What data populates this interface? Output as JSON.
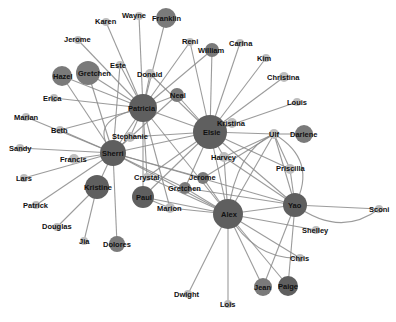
{
  "colors": {
    "large_node": "#5f5f5f",
    "medium_node": "#7a7a7a",
    "small_node": "#bdbdbd",
    "edge": "#8a8a8a",
    "label": "#111111"
  },
  "nodes": [
    {
      "id": "Wayne",
      "x": 139,
      "y": 16,
      "r": 4,
      "tone": "small",
      "lx": 122,
      "ly": 18
    },
    {
      "id": "Franklin",
      "x": 166,
      "y": 18,
      "r": 10,
      "tone": "medium",
      "lx": 152,
      "ly": 21
    },
    {
      "id": "Karen",
      "x": 106,
      "y": 22,
      "r": 4,
      "tone": "small",
      "lx": 95,
      "ly": 24
    },
    {
      "id": "Jerome",
      "x": 78,
      "y": 40,
      "r": 4,
      "tone": "small",
      "lx": 64,
      "ly": 42
    },
    {
      "id": "Este",
      "x": 120,
      "y": 65,
      "r": 4,
      "tone": "small",
      "lx": 110,
      "ly": 68
    },
    {
      "id": "Hazel",
      "x": 62,
      "y": 76,
      "r": 10,
      "tone": "medium",
      "lx": 53,
      "ly": 79
    },
    {
      "id": "Gretchen",
      "x": 88,
      "y": 73,
      "r": 12,
      "tone": "medium",
      "lx": 78,
      "ly": 76
    },
    {
      "id": "Donald",
      "x": 150,
      "y": 74,
      "r": 5,
      "tone": "small",
      "lx": 137,
      "ly": 77
    },
    {
      "id": "Reni",
      "x": 190,
      "y": 42,
      "r": 4,
      "tone": "small",
      "lx": 182,
      "ly": 44
    },
    {
      "id": "William",
      "x": 212,
      "y": 50,
      "r": 7,
      "tone": "medium",
      "lx": 198,
      "ly": 53
    },
    {
      "id": "Carina",
      "x": 240,
      "y": 43,
      "r": 4,
      "tone": "small",
      "lx": 229,
      "ly": 46
    },
    {
      "id": "Kim",
      "x": 266,
      "y": 58,
      "r": 4,
      "tone": "small",
      "lx": 257,
      "ly": 61
    },
    {
      "id": "Christina",
      "x": 284,
      "y": 77,
      "r": 5,
      "tone": "small",
      "lx": 267,
      "ly": 80
    },
    {
      "id": "Louis",
      "x": 297,
      "y": 102,
      "r": 4,
      "tone": "small",
      "lx": 287,
      "ly": 105
    },
    {
      "id": "Erica",
      "x": 54,
      "y": 98,
      "r": 4,
      "tone": "small",
      "lx": 43,
      "ly": 101
    },
    {
      "id": "Neal",
      "x": 177,
      "y": 95,
      "r": 7,
      "tone": "medium",
      "lx": 170,
      "ly": 98
    },
    {
      "id": "Patricia",
      "x": 143,
      "y": 108,
      "r": 14,
      "tone": "large",
      "lx": 128,
      "ly": 111
    },
    {
      "id": "Kristina",
      "x": 232,
      "y": 123,
      "r": 5,
      "tone": "small",
      "lx": 217,
      "ly": 126
    },
    {
      "id": "Elsie",
      "x": 210,
      "y": 132,
      "r": 17,
      "tone": "large",
      "lx": 203,
      "ly": 135
    },
    {
      "id": "Marian",
      "x": 26,
      "y": 117,
      "r": 4,
      "tone": "small",
      "lx": 14,
      "ly": 120
    },
    {
      "id": "Beth",
      "x": 60,
      "y": 130,
      "r": 4,
      "tone": "small",
      "lx": 51,
      "ly": 133
    },
    {
      "id": "Stephanie",
      "x": 130,
      "y": 137,
      "r": 5,
      "tone": "small",
      "lx": 112,
      "ly": 139
    },
    {
      "id": "Ulf",
      "x": 274,
      "y": 134,
      "r": 5,
      "tone": "small",
      "lx": 269,
      "ly": 137
    },
    {
      "id": "Darlene",
      "x": 304,
      "y": 134,
      "r": 9,
      "tone": "medium",
      "lx": 290,
      "ly": 137
    },
    {
      "id": "Sandy",
      "x": 20,
      "y": 148,
      "r": 4,
      "tone": "small",
      "lx": 9,
      "ly": 151
    },
    {
      "id": "Sherri",
      "x": 113,
      "y": 153,
      "r": 13,
      "tone": "large",
      "lx": 102,
      "ly": 156
    },
    {
      "id": "Francis",
      "x": 74,
      "y": 159,
      "r": 5,
      "tone": "small",
      "lx": 60,
      "ly": 162
    },
    {
      "id": "Harvey",
      "x": 224,
      "y": 157,
      "r": 5,
      "tone": "small",
      "lx": 211,
      "ly": 160
    },
    {
      "id": "Priscilla",
      "x": 290,
      "y": 169,
      "r": 5,
      "tone": "small",
      "lx": 276,
      "ly": 171
    },
    {
      "id": "Lars",
      "x": 24,
      "y": 178,
      "r": 4,
      "tone": "small",
      "lx": 16,
      "ly": 181
    },
    {
      "id": "Crystal",
      "x": 147,
      "y": 177,
      "r": 4,
      "tone": "small",
      "lx": 134,
      "ly": 180
    },
    {
      "id": "Jerome2",
      "label": "Jerome",
      "x": 203,
      "y": 178,
      "r": 6,
      "tone": "medium",
      "lx": 189,
      "ly": 180
    },
    {
      "id": "Kristine",
      "x": 97,
      "y": 187,
      "r": 12,
      "tone": "large",
      "lx": 84,
      "ly": 190
    },
    {
      "id": "Gretchen2",
      "label": "Gretchen",
      "x": 185,
      "y": 188,
      "r": 6,
      "tone": "medium",
      "lx": 168,
      "ly": 191
    },
    {
      "id": "Paul",
      "x": 143,
      "y": 197,
      "r": 11,
      "tone": "large",
      "lx": 136,
      "ly": 200
    },
    {
      "id": "Marion",
      "x": 170,
      "y": 208,
      "r": 5,
      "tone": "small",
      "lx": 157,
      "ly": 211
    },
    {
      "id": "Yao",
      "x": 295,
      "y": 205,
      "r": 12,
      "tone": "large",
      "lx": 288,
      "ly": 208
    },
    {
      "id": "Alex",
      "x": 228,
      "y": 214,
      "r": 15,
      "tone": "large",
      "lx": 221,
      "ly": 217
    },
    {
      "id": "Sconi",
      "x": 379,
      "y": 209,
      "r": 4,
      "tone": "small",
      "lx": 369,
      "ly": 212
    },
    {
      "id": "Patrick",
      "x": 36,
      "y": 205,
      "r": 4,
      "tone": "small",
      "lx": 23,
      "ly": 208
    },
    {
      "id": "Shelley",
      "x": 316,
      "y": 230,
      "r": 4,
      "tone": "small",
      "lx": 302,
      "ly": 233
    },
    {
      "id": "Douglas",
      "x": 57,
      "y": 227,
      "r": 4,
      "tone": "small",
      "lx": 42,
      "ly": 229
    },
    {
      "id": "Jia",
      "x": 84,
      "y": 241,
      "r": 4,
      "tone": "small",
      "lx": 79,
      "ly": 244
    },
    {
      "id": "Dolores",
      "x": 117,
      "y": 244,
      "r": 8,
      "tone": "medium",
      "lx": 103,
      "ly": 247
    },
    {
      "id": "Chris",
      "x": 300,
      "y": 258,
      "r": 4,
      "tone": "small",
      "lx": 290,
      "ly": 261
    },
    {
      "id": "Jean",
      "x": 263,
      "y": 287,
      "r": 9,
      "tone": "medium",
      "lx": 254,
      "ly": 290
    },
    {
      "id": "Paige",
      "x": 288,
      "y": 286,
      "r": 10,
      "tone": "large",
      "lx": 278,
      "ly": 289
    },
    {
      "id": "Dwight",
      "x": 188,
      "y": 294,
      "r": 4,
      "tone": "small",
      "lx": 174,
      "ly": 297
    },
    {
      "id": "Lois",
      "x": 228,
      "y": 304,
      "r": 4,
      "tone": "small",
      "lx": 220,
      "ly": 307
    }
  ],
  "edges": [
    [
      "Patricia",
      "Karen"
    ],
    [
      "Patricia",
      "Wayne"
    ],
    [
      "Patricia",
      "Franklin"
    ],
    [
      "Patricia",
      "Jerome"
    ],
    [
      "Patricia",
      "Este"
    ],
    [
      "Patricia",
      "Hazel"
    ],
    [
      "Patricia",
      "Gretchen"
    ],
    [
      "Patricia",
      "Donald"
    ],
    [
      "Patricia",
      "Erica"
    ],
    [
      "Patricia",
      "Neal"
    ],
    [
      "Patricia",
      "Beth"
    ],
    [
      "Patricia",
      "Stephanie"
    ],
    [
      "Patricia",
      "Sherri"
    ],
    [
      "Patricia",
      "Elsie"
    ],
    [
      "Patricia",
      "Reni"
    ],
    [
      "Patricia",
      "William"
    ],
    [
      "Patricia",
      "Crystal"
    ],
    [
      "Patricia",
      "Paul"
    ],
    [
      "Patricia",
      "Alex"
    ],
    [
      "Patricia",
      "Marion"
    ],
    [
      "Sherri",
      "Hazel"
    ],
    [
      "Sherri",
      "Gretchen"
    ],
    [
      "Sherri",
      "Este"
    ],
    [
      "Sherri",
      "Marian"
    ],
    [
      "Sherri",
      "Sandy"
    ],
    [
      "Sherri",
      "Francis"
    ],
    [
      "Sherri",
      "Lars"
    ],
    [
      "Sherri",
      "Patrick"
    ],
    [
      "Sherri",
      "Kristine"
    ],
    [
      "Sherri",
      "Dolores"
    ],
    [
      "Sherri",
      "Elsie"
    ],
    [
      "Sherri",
      "Alex"
    ],
    [
      "Sherri",
      "Yao"
    ],
    [
      "Sherri",
      "Stephanie"
    ],
    [
      "Sherri",
      "Beth"
    ],
    [
      "Sherri",
      "Neal"
    ],
    [
      "Sherri",
      "Gretchen2"
    ],
    [
      "Sherri",
      "Jerome2"
    ],
    [
      "Kristine",
      "Douglas"
    ],
    [
      "Kristine",
      "Jia"
    ],
    [
      "Elsie",
      "Reni"
    ],
    [
      "Elsie",
      "William"
    ],
    [
      "Elsie",
      "Carina"
    ],
    [
      "Elsie",
      "Kim"
    ],
    [
      "Elsie",
      "Christina"
    ],
    [
      "Elsie",
      "Louis"
    ],
    [
      "Elsie",
      "Kristina"
    ],
    [
      "Elsie",
      "Ulf"
    ],
    [
      "Elsie",
      "Harvey"
    ],
    [
      "Elsie",
      "Neal"
    ],
    [
      "Elsie",
      "Donald"
    ],
    [
      "Elsie",
      "Stephanie"
    ],
    [
      "Elsie",
      "Alex"
    ],
    [
      "Elsie",
      "Yao"
    ],
    [
      "Elsie",
      "Paul"
    ],
    [
      "Elsie",
      "Crystal"
    ],
    [
      "Elsie",
      "Priscilla"
    ],
    [
      "Elsie",
      "Gretchen2"
    ],
    [
      "Ulf",
      "Darlene"
    ],
    [
      "Ulf",
      "Yao"
    ],
    [
      "Ulf",
      "Alex"
    ],
    [
      "Ulf",
      "Jerome2"
    ],
    [
      "Ulf",
      "Priscilla"
    ],
    [
      "Ulf",
      "Harvey"
    ],
    [
      "Yao",
      "Sconi"
    ],
    [
      "Yao",
      "Alex"
    ],
    [
      "Yao",
      "Jean"
    ],
    [
      "Yao",
      "Paige"
    ],
    [
      "Yao",
      "Priscilla"
    ],
    [
      "Yao",
      "Harvey"
    ],
    [
      "Yao",
      "Gretchen2"
    ],
    [
      "Alex",
      "Shelley"
    ],
    [
      "Alex",
      "Chris"
    ],
    [
      "Alex",
      "Jean"
    ],
    [
      "Alex",
      "Paige"
    ],
    [
      "Alex",
      "Dwight"
    ],
    [
      "Alex",
      "Lois"
    ],
    [
      "Alex",
      "Jerome2"
    ],
    [
      "Alex",
      "Gretchen2"
    ],
    [
      "Alex",
      "Harvey"
    ],
    [
      "Alex",
      "Paul"
    ],
    [
      "Alex",
      "Marion"
    ],
    [
      "Alex",
      "Crystal"
    ],
    [
      "Paul",
      "Marion"
    ]
  ],
  "curved_edges": [
    {
      "from": "Yao",
      "to": "Sconi",
      "cx": 340,
      "cy": 238
    },
    {
      "from": "Ulf",
      "to": "Yao",
      "cx": 318,
      "cy": 160
    },
    {
      "from": "Alex",
      "to": "Chris",
      "cx": 255,
      "cy": 260
    },
    {
      "from": "Sherri",
      "to": "Patricia",
      "cx": 85,
      "cy": 120
    },
    {
      "from": "Alex",
      "to": "Ulf",
      "cx": 236,
      "cy": 150
    }
  ]
}
